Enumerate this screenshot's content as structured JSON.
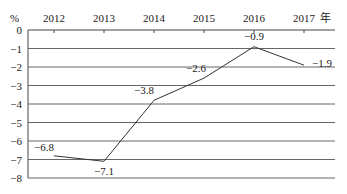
{
  "chart_data": {
    "type": "line",
    "title": "",
    "xlabel": "年",
    "ylabel": "%",
    "categories": [
      "2012",
      "2013",
      "2014",
      "2015",
      "2016",
      "2017"
    ],
    "series": [
      {
        "name": "",
        "values": [
          -6.8,
          -7.1,
          -3.8,
          -2.6,
          -0.9,
          -1.9
        ]
      }
    ],
    "data_labels": [
      "−6.8",
      "−7.1",
      "−3.8",
      "−2.6",
      "−0.9",
      "−1.9"
    ],
    "y_ticks": [
      "0",
      "−1",
      "−2",
      "−3",
      "−4",
      "−5",
      "−6",
      "−7",
      "−8"
    ],
    "ylim": [
      -8,
      0
    ],
    "grid": true,
    "x_axis_position": "top",
    "legend": null
  }
}
